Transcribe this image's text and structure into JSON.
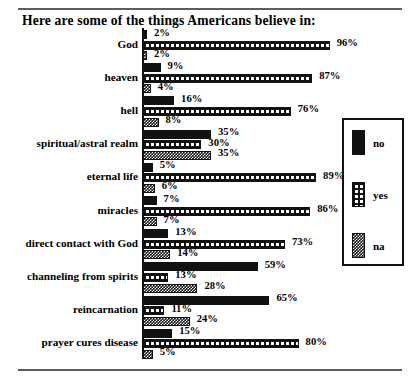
{
  "title": "Here are some of the things Americans believe in:",
  "colors": {
    "ink": "#111111",
    "rule": "#5d5d5d",
    "background": "#ffffff"
  },
  "legend": {
    "name": "legend-box",
    "position": "right",
    "entries": [
      {
        "key": "no",
        "label": "no",
        "swatch": "solid-black-swatch"
      },
      {
        "key": "yes",
        "label": "yes",
        "swatch": "white-dot-on-black-swatch"
      },
      {
        "key": "na",
        "label": "na",
        "swatch": "checkered-gray-swatch"
      }
    ]
  },
  "chart_data": {
    "type": "bar",
    "orientation": "horizontal",
    "title": "Here are some of the things Americans believe in:",
    "xlabel": "",
    "ylabel": "",
    "xlim": [
      0,
      100
    ],
    "grid": false,
    "legend_position": "right",
    "value_suffix": "%",
    "categories": [
      "God",
      "heaven",
      "hell",
      "spiritual/astral realm",
      "eternal life",
      "miracles",
      "direct contact with God",
      "channeling from spirits",
      "reincarnation",
      "prayer cures disease"
    ],
    "series": [
      {
        "name": "no",
        "values": [
          2,
          9,
          16,
          35,
          5,
          7,
          13,
          59,
          65,
          15
        ]
      },
      {
        "name": "yes",
        "values": [
          96,
          87,
          76,
          30,
          89,
          86,
          73,
          13,
          11,
          80
        ]
      },
      {
        "name": "na",
        "values": [
          2,
          4,
          8,
          35,
          6,
          7,
          14,
          28,
          24,
          5
        ]
      }
    ],
    "labels": {
      "no": [
        "2%",
        "9%",
        "16%",
        "35%",
        "5%",
        "7%",
        "13%",
        "59%",
        "65%",
        "15%"
      ],
      "yes": [
        "96%",
        "87%",
        "76%",
        "30%",
        "89%",
        "86%",
        "73%",
        "13%",
        "11%",
        "80%"
      ],
      "na": [
        "2%",
        "4%",
        "8%",
        "35%",
        "6%",
        "7%",
        "14%",
        "28%",
        "24%",
        "5%"
      ]
    }
  }
}
